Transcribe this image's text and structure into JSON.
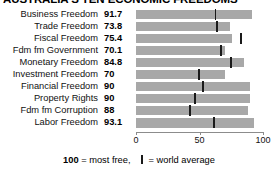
{
  "title": "AUSTRALIA'S TEN ECONOMIC FREEDOMS",
  "legend": {
    "scale_value": "100",
    "scale_text": "= most free,",
    "mark_name": "world-average-mark",
    "mark_text": "= world average"
  },
  "axis": {
    "ticks": [
      "0",
      "50",
      "100"
    ],
    "min": 0,
    "max": 100
  },
  "colors": {
    "bar": "#a8a8a8",
    "tick": "#1a1a1a",
    "text": "#000000",
    "background": "#ffffff",
    "axis": "#8c8c8c"
  },
  "chart_data": {
    "type": "bar",
    "orientation": "horizontal",
    "title": "AUSTRALIA'S TEN ECONOMIC FREEDOMS",
    "xlabel": "",
    "ylabel": "",
    "xlim": [
      0,
      100
    ],
    "grid": false,
    "legend_position": "bottom",
    "xticks": [
      0,
      50,
      100
    ],
    "categories": [
      "Business Freedom",
      "Trade Freedom",
      "Fiscal Freedom",
      "Fdm fm Government",
      "Monetary Freedom",
      "Investment Freedom",
      "Financial Freedom",
      "Property Rights",
      "Fdm fm Corruption",
      "Labor Freedom"
    ],
    "values": [
      91.7,
      73.8,
      75.4,
      70.1,
      84.8,
      70,
      90,
      90,
      88,
      93.1
    ],
    "value_labels": [
      "91.7",
      "73.8",
      "75.4",
      "70.1",
      "84.8",
      "70",
      "90",
      "90",
      "88",
      "93.1"
    ],
    "series": [
      {
        "name": "Australia score",
        "values": [
          91.7,
          73.8,
          75.4,
          70.1,
          84.8,
          70,
          90,
          90,
          88,
          93.1
        ]
      },
      {
        "name": "world average",
        "marker": "vertical-tick",
        "values": [
          62,
          63,
          82,
          66,
          74,
          49,
          52,
          46,
          42,
          61
        ]
      }
    ],
    "annotations": [
      "100 = most free",
      "| = world average"
    ]
  },
  "rows": [
    {
      "label": "Business Freedom",
      "value": "91.7",
      "bar": 91.7,
      "avg": 62
    },
    {
      "label": "Trade Freedom",
      "value": "73.8",
      "bar": 73.8,
      "avg": 63
    },
    {
      "label": "Fiscal Freedom",
      "value": "75.4",
      "bar": 75.4,
      "avg": 82
    },
    {
      "label": "Fdm fm Government",
      "value": "70.1",
      "bar": 70.1,
      "avg": 66
    },
    {
      "label": "Monetary Freedom",
      "value": "84.8",
      "bar": 84.8,
      "avg": 74
    },
    {
      "label": "Investment Freedom",
      "value": "70",
      "bar": 70,
      "avg": 49
    },
    {
      "label": "Financial Freedom",
      "value": "90",
      "bar": 90,
      "avg": 52
    },
    {
      "label": "Property Rights",
      "value": "90",
      "bar": 90,
      "avg": 46
    },
    {
      "label": "Fdm fm Corruption",
      "value": "88",
      "bar": 88,
      "avg": 42
    },
    {
      "label": "Labor Freedom",
      "value": "93.1",
      "bar": 93.1,
      "avg": 61
    }
  ]
}
